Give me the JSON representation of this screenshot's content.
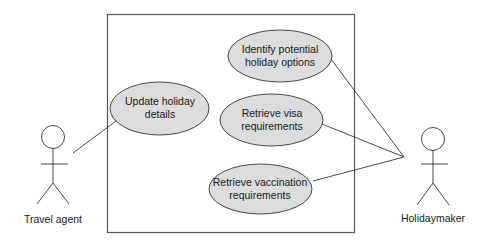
{
  "diagram": {
    "type": "use-case",
    "colors": {
      "stroke": "#333333",
      "boundary_stroke": "#555555",
      "usecase_fill": "#dcdcdc",
      "text": "#1a1a1a"
    },
    "actors": [
      {
        "id": "travel_agent",
        "label": "Travel agent"
      },
      {
        "id": "holidaymaker",
        "label": "Holidaymaker"
      }
    ],
    "use_cases": [
      {
        "id": "identify",
        "line1": "Identify potential",
        "line2": "holiday options"
      },
      {
        "id": "update",
        "line1": "Update holiday",
        "line2": "details"
      },
      {
        "id": "visa",
        "line1": "Retrieve visa",
        "line2": "requirements"
      },
      {
        "id": "vaccination",
        "line1": "Retrieve vaccination",
        "line2": "requirements"
      }
    ],
    "associations": [
      {
        "actor": "Travel agent",
        "use_case": "Update holiday details"
      },
      {
        "actor": "Holidaymaker",
        "use_case": "Identify potential holiday options"
      },
      {
        "actor": "Holidaymaker",
        "use_case": "Retrieve visa requirements"
      },
      {
        "actor": "Holidaymaker",
        "use_case": "Retrieve vaccination requirements"
      }
    ]
  }
}
